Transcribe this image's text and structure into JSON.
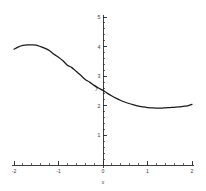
{
  "chart_data": {
    "type": "line",
    "title": "",
    "xlabel": "x",
    "ylabel": "y",
    "xlim": [
      -2,
      2
    ],
    "ylim": [
      0,
      5
    ],
    "grid": false,
    "legend": null,
    "x_ticks": [
      -2,
      -1,
      0,
      1,
      2
    ],
    "x_tick_labels": [
      "-2",
      "-1",
      "0",
      "1",
      "2"
    ],
    "y_ticks": [
      1,
      2,
      3,
      4,
      5
    ],
    "y_tick_labels": [
      "1",
      "2",
      "3",
      "4",
      "5"
    ],
    "x_minor_tick_step": 0.2,
    "y_minor_tick_step": 0.2,
    "series": [
      {
        "name": "curve",
        "color": "#1a1a1a",
        "x": [
          -2.0,
          -1.9,
          -1.8,
          -1.7,
          -1.6,
          -1.5,
          -1.4,
          -1.3,
          -1.2,
          -1.1,
          -1.0,
          -0.9,
          -0.8,
          -0.7,
          -0.6,
          -0.5,
          -0.4,
          -0.3,
          -0.2,
          -0.1,
          0.0,
          0.1,
          0.2,
          0.3,
          0.4,
          0.5,
          0.6,
          0.7,
          0.8,
          0.9,
          1.0,
          1.1,
          1.2,
          1.3,
          1.4,
          1.5,
          1.6,
          1.7,
          1.8,
          1.9,
          2.0
        ],
        "y": [
          3.91,
          3.99,
          4.04,
          4.06,
          4.06,
          4.05,
          4.0,
          3.94,
          3.86,
          3.74,
          3.64,
          3.52,
          3.37,
          3.29,
          3.16,
          3.03,
          2.89,
          2.8,
          2.69,
          2.6,
          2.52,
          2.42,
          2.33,
          2.25,
          2.18,
          2.12,
          2.07,
          2.03,
          1.99,
          1.96,
          1.94,
          1.93,
          1.92,
          1.92,
          1.93,
          1.94,
          1.95,
          1.96,
          1.98,
          2.0,
          2.05
        ]
      }
    ]
  },
  "axes": {
    "x_axis_name": "x",
    "y_axis_name": "y"
  }
}
